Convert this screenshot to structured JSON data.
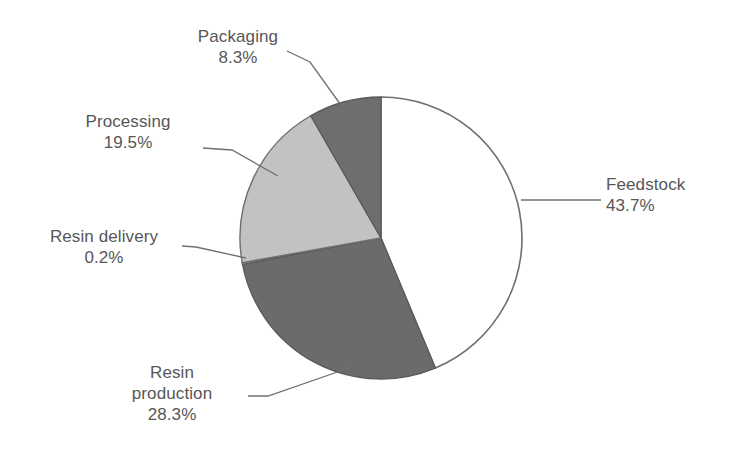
{
  "chart_data": {
    "type": "pie",
    "title": "",
    "subtitle": "",
    "xlabel": "",
    "ylabel": "",
    "legend_position": "none",
    "grid": false,
    "units": "percent",
    "start_angle_deg": 0,
    "direction": "clockwise",
    "categories": [
      "Feedstock",
      "Resin production",
      "Resin delivery",
      "Processing",
      "Packaging"
    ],
    "values": [
      43.7,
      28.3,
      0.2,
      19.5,
      8.3
    ],
    "slices": [
      {
        "label": "Feedstock",
        "value": 43.7,
        "value_text": "43.7%",
        "color": "#ffffff",
        "outline": "#6f6f6f",
        "label_align": "left"
      },
      {
        "label": "Resin production",
        "label_line1": "Resin",
        "label_line2": "production",
        "value": 28.3,
        "value_text": "28.3%",
        "color": "#6b6b6b",
        "outline": "#5a5a5a",
        "label_align": "center"
      },
      {
        "label": "Resin delivery",
        "value": 0.2,
        "value_text": "0.2%",
        "color": "#a8a8a8",
        "outline": "#5a5a5a",
        "label_align": "center"
      },
      {
        "label": "Processing",
        "value": 19.5,
        "value_text": "19.5%",
        "color": "#c2c2c2",
        "outline": "#6f6f6f",
        "label_align": "center"
      },
      {
        "label": "Packaging",
        "value": 8.3,
        "value_text": "8.3%",
        "color": "#6e6e6e",
        "outline": "#5a5a5a",
        "label_align": "center"
      }
    ]
  },
  "labels": {
    "packaging": {
      "name": "Packaging",
      "value": "8.3%"
    },
    "processing": {
      "name": "Processing",
      "value": "19.5%"
    },
    "resin_delivery": {
      "name": "Resin delivery",
      "value": "0.2%"
    },
    "resin_production": {
      "name_line1": "Resin",
      "name_line2": "production",
      "value": "28.3%"
    },
    "feedstock": {
      "name": "Feedstock",
      "value": "43.7%"
    }
  },
  "colors": {
    "background": "#ffffff",
    "text": "#575757",
    "leader_line": "#6f6f6f",
    "slice_white": "#ffffff",
    "slice_light_gray": "#c2c2c2",
    "slice_mid_gray": "#a8a8a8",
    "slice_dark_gray": "#6b6b6b",
    "slice_dark_gray_2": "#6e6e6e",
    "outline": "#6f6f6f"
  }
}
